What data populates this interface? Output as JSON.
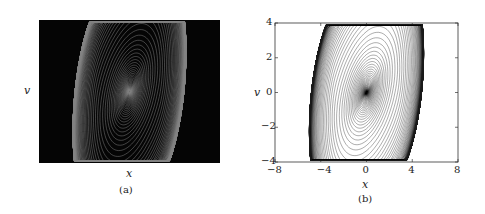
{
  "chart_data": [
    {
      "type": "image",
      "panel": "(a)",
      "description": "Double-scroll chaotic attractor phase portrait rendered as bright white trajectories on black background",
      "xlabel": "x",
      "ylabel": "v",
      "background": "#000000",
      "trace_color": "#ffffff",
      "ticks": "none"
    },
    {
      "type": "line",
      "panel": "(b)",
      "description": "Double-scroll chaotic attractor phase portrait, dark trajectories on white background",
      "xlabel": "x",
      "ylabel": "v",
      "xlim": [
        -8,
        8
      ],
      "ylim": [
        -4,
        4
      ],
      "xticks": [
        -8,
        -4,
        0,
        4,
        8
      ],
      "yticks": [
        -4,
        -2,
        0,
        2,
        4
      ],
      "grid": false,
      "trace_color": "#222222"
    }
  ],
  "panels": {
    "a": {
      "caption": "(a)",
      "xlabel": "x",
      "ylabel": "v"
    },
    "b": {
      "caption": "(b)",
      "xlabel": "x",
      "ylabel": "v",
      "xticks": [
        "−8",
        "−4",
        "0",
        "4",
        "8"
      ],
      "yticks": [
        "4",
        "2",
        "0",
        "−2",
        "−4"
      ]
    }
  }
}
